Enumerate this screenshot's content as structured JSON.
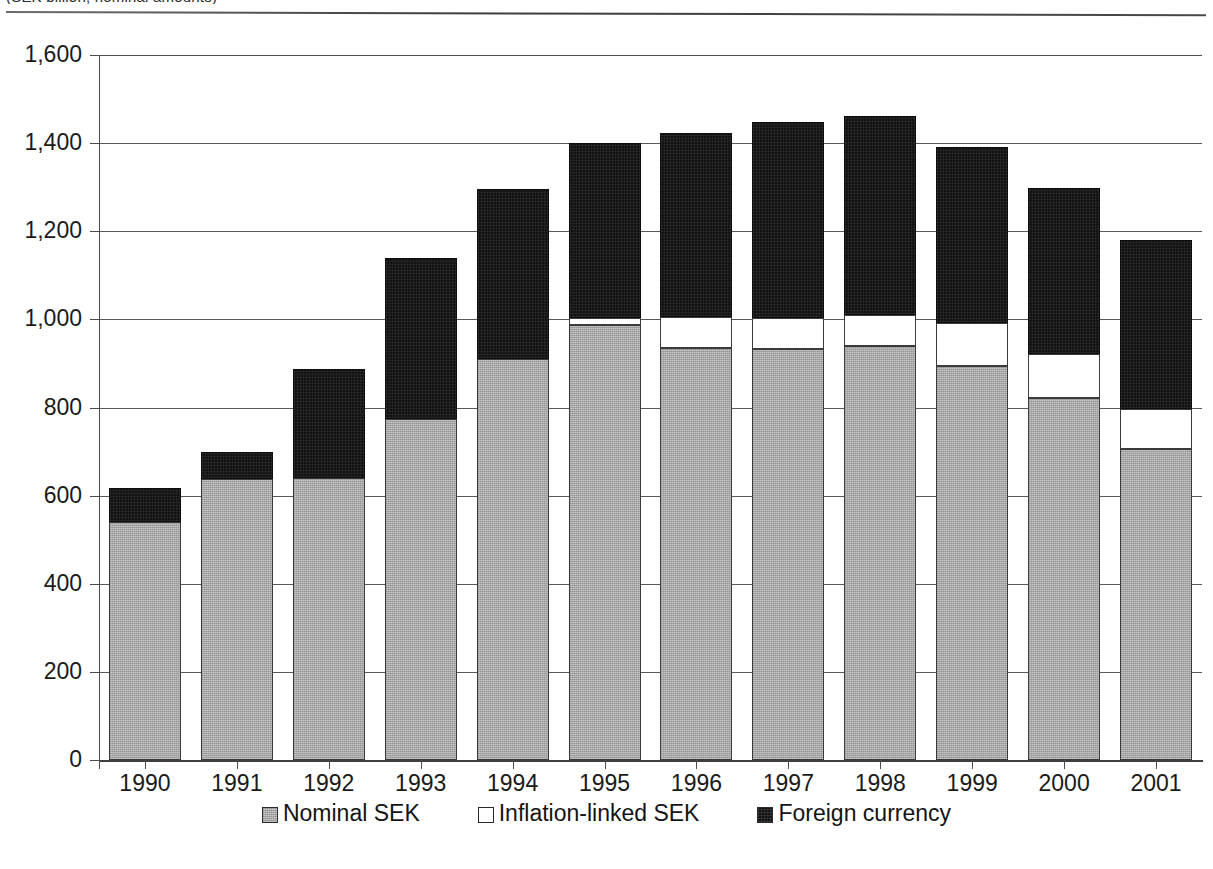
{
  "figure": {
    "caption_clipped": "(SEK billion, nominal amounts)",
    "legend_position": "bottom-center"
  },
  "chart_data": {
    "type": "bar",
    "subtype": "stacked-bar",
    "title": "",
    "subtitle": "",
    "xlabel": "",
    "ylabel": "",
    "ylim": [
      0,
      1600
    ],
    "ytick_step": 200,
    "ytick_labels": [
      "0",
      "200",
      "400",
      "600",
      "800",
      "1,000",
      "1,200",
      "1,400",
      "1,600"
    ],
    "ytick_values": [
      0,
      200,
      400,
      600,
      800,
      1000,
      1200,
      1400,
      1600
    ],
    "grid": true,
    "grid_axis": "y",
    "categories": [
      "1990",
      "1991",
      "1992",
      "1993",
      "1994",
      "1995",
      "1996",
      "1997",
      "1998",
      "1999",
      "2000",
      "2001"
    ],
    "series": [
      {
        "name": "Nominal SEK",
        "color": "#a8a8a8",
        "values": [
          540,
          637,
          639,
          775,
          910,
          988,
          935,
          932,
          940,
          895,
          822,
          705
        ]
      },
      {
        "name": "Inflation-linked SEK",
        "color": "#ffffff",
        "values": [
          0,
          0,
          0,
          0,
          0,
          15,
          70,
          72,
          70,
          97,
          100,
          92
        ]
      },
      {
        "name": "Foreign currency",
        "color": "#141414",
        "values": [
          78,
          61,
          249,
          365,
          385,
          397,
          417,
          444,
          452,
          400,
          376,
          383
        ]
      }
    ],
    "totals": [
      618,
      698,
      888,
      1140,
      1295,
      1400,
      1422,
      1448,
      1462,
      1392,
      1298,
      1180
    ]
  },
  "legend": {
    "items": [
      {
        "label": "Nominal SEK",
        "swatch": "gray-swatch"
      },
      {
        "label": "Inflation-linked SEK",
        "swatch": "white-swatch"
      },
      {
        "label": "Foreign currency",
        "swatch": "black-swatch"
      }
    ]
  }
}
